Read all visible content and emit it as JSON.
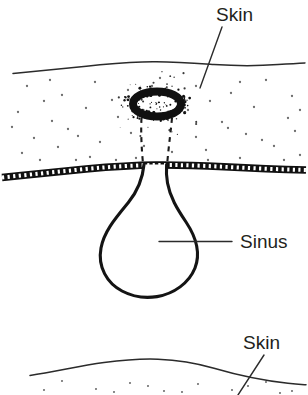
{
  "figure": {
    "background_color": "#ffffff",
    "ink_color": "#1a1a1a",
    "text_color": "#231f20",
    "width": 308,
    "height": 395
  },
  "labels": {
    "skin_top": "Skin",
    "sinus": "Sinus",
    "skin_bottom": "Skin"
  },
  "structures": {
    "skin_surface_top": "skin-surface-line",
    "skin_surface_bottom": "skin-surface-line-lower",
    "subcutaneous_fat": "stippled-subcutaneous-tissue",
    "deep_fascia": "fascia-band",
    "pore": "sinus-opening-pore",
    "tract": "sinus-tract-dashed",
    "cavity": "sinus-cavity"
  },
  "stipple_dots": [
    [
      27,
      86
    ],
    [
      62,
      95
    ],
    [
      95,
      82
    ],
    [
      128,
      90
    ],
    [
      160,
      78
    ],
    [
      196,
      86
    ],
    [
      231,
      93
    ],
    [
      266,
      80
    ],
    [
      292,
      96
    ],
    [
      18,
      112
    ],
    [
      52,
      121
    ],
    [
      86,
      108
    ],
    [
      118,
      117
    ],
    [
      188,
      110
    ],
    [
      222,
      122
    ],
    [
      254,
      107
    ],
    [
      288,
      118
    ],
    [
      34,
      138
    ],
    [
      68,
      129
    ],
    [
      100,
      142
    ],
    [
      131,
      133
    ],
    [
      196,
      137
    ],
    [
      228,
      128
    ],
    [
      262,
      140
    ],
    [
      295,
      131
    ],
    [
      22,
      153
    ],
    [
      58,
      147
    ],
    [
      90,
      157
    ],
    [
      206,
      150
    ],
    [
      240,
      158
    ],
    [
      274,
      146
    ],
    [
      300,
      155
    ],
    [
      44,
      101
    ],
    [
      78,
      136
    ],
    [
      210,
      101
    ],
    [
      246,
      134
    ],
    [
      144,
      146
    ],
    [
      172,
      152
    ],
    [
      12,
      127
    ],
    [
      40,
      160
    ],
    [
      168,
      120
    ],
    [
      300,
      110
    ],
    [
      76,
      160
    ],
    [
      116,
      160
    ],
    [
      284,
      160
    ],
    [
      152,
      86
    ],
    [
      178,
      96
    ],
    [
      136,
      158
    ],
    [
      208,
      160
    ],
    [
      50,
      80
    ],
    [
      112,
      100
    ],
    [
      240,
      82
    ]
  ],
  "stipple_dots_lower": [
    [
      62,
      381
    ],
    [
      96,
      389
    ],
    [
      130,
      383
    ],
    [
      164,
      391
    ],
    [
      198,
      384
    ],
    [
      232,
      390
    ],
    [
      266,
      382
    ],
    [
      292,
      391
    ],
    [
      44,
      390
    ],
    [
      114,
      392
    ],
    [
      148,
      386
    ],
    [
      182,
      392
    ],
    [
      248,
      386
    ],
    [
      280,
      393
    ]
  ],
  "pore": {
    "center_x": 157,
    "center_y": 104,
    "rx": 24,
    "ry": 12,
    "color": "#111111"
  },
  "colors": {
    "ink": "#1a1a1a",
    "text": "#231f20",
    "surface": "#2b2b2b",
    "stipple": "#6d6d6d",
    "paper": "#ffffff"
  }
}
